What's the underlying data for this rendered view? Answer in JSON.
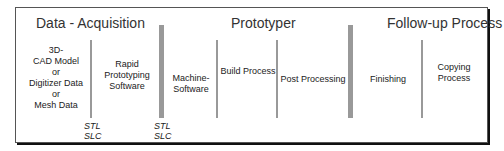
{
  "diagram": {
    "sections": [
      {
        "title": "Data - Acquisition"
      },
      {
        "title": "Prototyper"
      },
      {
        "title": "Follow-up Process"
      }
    ],
    "steps": [
      {
        "label": "3D-\nCAD Model\nor\nDigitizer Data\nor\nMesh Data"
      },
      {
        "label": "Rapid\nPrototyping\nSoftware"
      },
      {
        "label": "Machine-\nSoftware"
      },
      {
        "label": "Build Process"
      },
      {
        "label": "Post Processing"
      },
      {
        "label": "Finishing"
      },
      {
        "label": "Copying\nProcess"
      }
    ],
    "formats": [
      {
        "line1": "STL",
        "line2": "SLC"
      },
      {
        "line1": "STL",
        "line2": "SLC"
      }
    ]
  }
}
